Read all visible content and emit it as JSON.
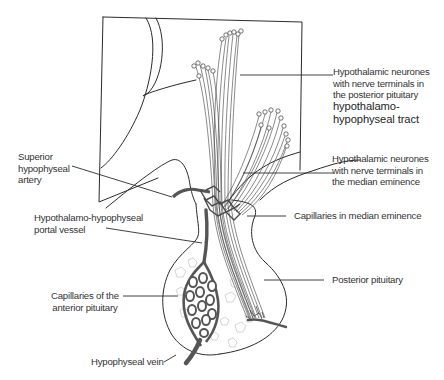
{
  "diagram": {
    "labels": {
      "posterior_neurones": [
        "Hypothalamic neurones",
        "with nerve terminals in",
        "the posterior pituitary"
      ],
      "tract": [
        "hypothalamo-",
        "hypophyseal tract"
      ],
      "median_neurones": [
        "Hypothalamic neurones",
        "with nerve terminals in",
        "the median eminence"
      ],
      "capillaries_median": "Capillaries in median eminence",
      "posterior_pituitary": "Posterior pituitary",
      "superior_artery": [
        "Superior",
        "hypophyseal",
        "artery"
      ],
      "portal_vessel": [
        "Hypothalamo-hypophyseal",
        "portal vessel"
      ],
      "capillaries_anterior": [
        "Capillaries of the",
        "anterior pituitary"
      ],
      "vein": "Hypophyseal vein"
    },
    "colors": {
      "line": "#2b2b2b",
      "vessel_fill": "#6e6e6e",
      "background": "#ffffff"
    }
  }
}
